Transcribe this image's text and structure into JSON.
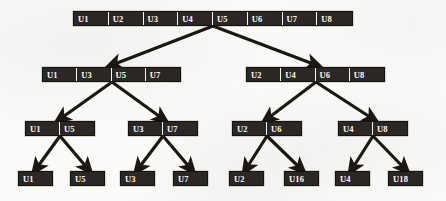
{
  "figure": {
    "background_color": "#fbfbfa",
    "node_fill_color": "#2a2724",
    "node_text_color": "#f4f2ee",
    "edge_color": "#1a1714"
  },
  "chart_data": {
    "type": "diagram",
    "subtype": "tree",
    "levels": 4,
    "orientation": "top-down",
    "node_label_prefix": "U",
    "nodes": [
      {
        "id": "root",
        "level": 0,
        "cells": [
          "U1",
          "U2",
          "U3",
          "U4",
          "U5",
          "U6",
          "U7",
          "U8"
        ],
        "cell_count": 8,
        "x": 73,
        "y": 11,
        "width": 280,
        "height": 15
      },
      {
        "id": "L1-left",
        "level": 1,
        "cells": [
          "U1",
          "U3",
          "U5",
          "U7"
        ],
        "cell_count": 4,
        "x": 42,
        "y": 67,
        "width": 139,
        "height": 15
      },
      {
        "id": "L1-right",
        "level": 1,
        "cells": [
          "U2",
          "U4",
          "U6",
          "U8"
        ],
        "cell_count": 4,
        "x": 246,
        "y": 67,
        "width": 139,
        "height": 15
      },
      {
        "id": "L2-a",
        "level": 2,
        "cells": [
          "U1",
          "U5"
        ],
        "cell_count": 2,
        "x": 25,
        "y": 121,
        "width": 70,
        "height": 15
      },
      {
        "id": "L2-b",
        "level": 2,
        "cells": [
          "U3",
          "U7"
        ],
        "cell_count": 2,
        "x": 128,
        "y": 121,
        "width": 70,
        "height": 15
      },
      {
        "id": "L2-c",
        "level": 2,
        "cells": [
          "U2",
          "U6"
        ],
        "cell_count": 2,
        "x": 232,
        "y": 121,
        "width": 70,
        "height": 15
      },
      {
        "id": "L2-d",
        "level": 2,
        "cells": [
          "U4",
          "U8"
        ],
        "cell_count": 2,
        "x": 338,
        "y": 121,
        "width": 70,
        "height": 15
      },
      {
        "id": "L3-a",
        "level": 3,
        "cells": [
          "U1"
        ],
        "cell_count": 1,
        "x": 18,
        "y": 171,
        "width": 35,
        "height": 15
      },
      {
        "id": "L3-b",
        "level": 3,
        "cells": [
          "U5"
        ],
        "cell_count": 1,
        "x": 70,
        "y": 171,
        "width": 35,
        "height": 15
      },
      {
        "id": "L3-c",
        "level": 3,
        "cells": [
          "U3"
        ],
        "cell_count": 1,
        "x": 120,
        "y": 171,
        "width": 35,
        "height": 15
      },
      {
        "id": "L3-d",
        "level": 3,
        "cells": [
          "U7"
        ],
        "cell_count": 1,
        "x": 173,
        "y": 171,
        "width": 35,
        "height": 15
      },
      {
        "id": "L3-e",
        "level": 3,
        "cells": [
          "U2"
        ],
        "cell_count": 1,
        "x": 229,
        "y": 171,
        "width": 35,
        "height": 15
      },
      {
        "id": "L3-f",
        "level": 3,
        "cells": [
          "U16"
        ],
        "cell_count": 1,
        "x": 284,
        "y": 171,
        "width": 35,
        "height": 15
      },
      {
        "id": "L3-g",
        "level": 3,
        "cells": [
          "U4"
        ],
        "cell_count": 1,
        "x": 335,
        "y": 171,
        "width": 35,
        "height": 15
      },
      {
        "id": "L3-h",
        "level": 3,
        "cells": [
          "U18"
        ],
        "cell_count": 1,
        "x": 388,
        "y": 171,
        "width": 35,
        "height": 15
      }
    ],
    "edges": [
      {
        "from": "root",
        "to": "L1-left",
        "x1": 213,
        "y1": 26,
        "x2": 112,
        "y2": 65
      },
      {
        "from": "root",
        "to": "L1-right",
        "x1": 213,
        "y1": 26,
        "x2": 316,
        "y2": 65
      },
      {
        "from": "L1-left",
        "to": "L2-a",
        "x1": 112,
        "y1": 82,
        "x2": 60,
        "y2": 119
      },
      {
        "from": "L1-left",
        "to": "L2-b",
        "x1": 112,
        "y1": 82,
        "x2": 163,
        "y2": 119
      },
      {
        "from": "L1-right",
        "to": "L2-c",
        "x1": 316,
        "y1": 82,
        "x2": 267,
        "y2": 119
      },
      {
        "from": "L1-right",
        "to": "L2-d",
        "x1": 316,
        "y1": 82,
        "x2": 373,
        "y2": 119
      },
      {
        "from": "L2-a",
        "to": "L3-a",
        "x1": 60,
        "y1": 136,
        "x2": 36,
        "y2": 169
      },
      {
        "from": "L2-a",
        "to": "L3-b",
        "x1": 60,
        "y1": 136,
        "x2": 88,
        "y2": 169
      },
      {
        "from": "L2-b",
        "to": "L3-c",
        "x1": 163,
        "y1": 136,
        "x2": 138,
        "y2": 169
      },
      {
        "from": "L2-b",
        "to": "L3-d",
        "x1": 163,
        "y1": 136,
        "x2": 191,
        "y2": 169
      },
      {
        "from": "L2-c",
        "to": "L3-e",
        "x1": 267,
        "y1": 136,
        "x2": 246,
        "y2": 169
      },
      {
        "from": "L2-c",
        "to": "L3-f",
        "x1": 267,
        "y1": 136,
        "x2": 301,
        "y2": 169
      },
      {
        "from": "L2-d",
        "to": "L3-g",
        "x1": 373,
        "y1": 136,
        "x2": 352,
        "y2": 169
      },
      {
        "from": "L2-d",
        "to": "L3-h",
        "x1": 373,
        "y1": 136,
        "x2": 405,
        "y2": 169
      }
    ]
  }
}
